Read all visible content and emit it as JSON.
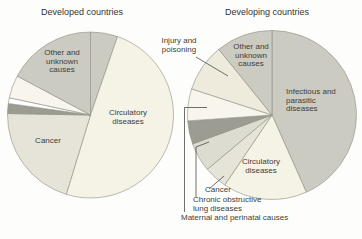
{
  "figure": {
    "background": "#fdfdfb",
    "text_color": "#3d3d3a",
    "slice_stroke": "#8e8e85",
    "leader_stroke": "#4a4a46"
  },
  "labels": {
    "title_developed": "Developed countries",
    "title_developing": "Developing countries",
    "other_unknown_left": "Other and\nunknown\ncauses",
    "circulatory_left": "Circulatory\ndiseases",
    "cancer_left": "Cancer",
    "injury_poisoning": "Injury and\npoisoning",
    "other_unknown_right": "Other and\nunknown\ncauses",
    "infectious": "Infectious and\nparasitic\ndiseases",
    "circulatory_right": "Circulatory\ndiseases",
    "cancer_right": "Cancer",
    "chronic": "Chronic obstructive\nlung diseases",
    "maternal": "Maternal and perinatal causes"
  },
  "chart_data": [
    {
      "type": "pie",
      "title": "Developed countries",
      "legend_position": "none",
      "center": {
        "x": 90.5,
        "y": 115
      },
      "radius": 83,
      "slices": [
        {
          "label": "",
          "value_pct": 5.3,
          "start_deg": 0,
          "end_deg": 19,
          "color": "#cbcbc1"
        },
        {
          "label": "Circulatory diseases",
          "value_pct": 49.4,
          "start_deg": 19,
          "end_deg": 197,
          "color": "#f5f2e6"
        },
        {
          "label": "Cancer",
          "value_pct": 20.6,
          "start_deg": 197,
          "end_deg": 271,
          "color": "#e6e4d8"
        },
        {
          "label": "",
          "value_pct": 1.9,
          "start_deg": 271,
          "end_deg": 278,
          "color": "#9c9c93"
        },
        {
          "label": "",
          "value_pct": 1.1,
          "start_deg": 278,
          "end_deg": 282,
          "color": "#ffffff"
        },
        {
          "label": "",
          "value_pct": 4.4,
          "start_deg": 282,
          "end_deg": 298,
          "color": "#f8f6ec"
        },
        {
          "label": "Other and unknown causes",
          "value_pct": 17.2,
          "start_deg": 298,
          "end_deg": 360,
          "color": "#cbcbc1"
        }
      ]
    },
    {
      "type": "pie",
      "title": "Developing countries",
      "legend_position": "none",
      "center": {
        "x": 272,
        "y": 115
      },
      "radius": 84.5,
      "slices": [
        {
          "label": "Infectious and parasitic diseases",
          "value_pct": 43.3,
          "start_deg": 0,
          "end_deg": 156,
          "color": "#cbcbc1"
        },
        {
          "label": "Circulatory diseases",
          "value_pct": 16.1,
          "start_deg": 156,
          "end_deg": 214,
          "color": "#f5f2e6"
        },
        {
          "label": "Cancer",
          "value_pct": 4.4,
          "start_deg": 214,
          "end_deg": 230,
          "color": "#e6e4d8"
        },
        {
          "label": "Chronic obstructive lung diseases",
          "value_pct": 5.6,
          "start_deg": 230,
          "end_deg": 250,
          "color": "#dddcd0"
        },
        {
          "label": "",
          "value_pct": 4.4,
          "start_deg": 250,
          "end_deg": 266,
          "color": "#9c9c93"
        },
        {
          "label": "Maternal and perinatal causes",
          "value_pct": 6.1,
          "start_deg": 266,
          "end_deg": 288,
          "color": "#f8f6ec"
        },
        {
          "label": "Injury and poisoning",
          "value_pct": 9.2,
          "start_deg": 288,
          "end_deg": 321,
          "color": "#eeebdd"
        },
        {
          "label": "Other and unknown causes",
          "value_pct": 10.8,
          "start_deg": 321,
          "end_deg": 360,
          "color": "#cbcbc1"
        }
      ]
    }
  ],
  "leader_lines": [
    {
      "target": "Injury and poisoning",
      "points": [
        [
          196,
          57
        ],
        [
          228,
          76
        ]
      ]
    },
    {
      "target": "Cancer (developing)",
      "points": [
        [
          209,
          189
        ],
        [
          224,
          176
        ]
      ]
    },
    {
      "target": "Chronic obstructive lung diseases",
      "points": [
        [
          196,
          197
        ],
        [
          196,
          147
        ],
        [
          209,
          142
        ]
      ]
    },
    {
      "target": "Maternal and perinatal causes",
      "points": [
        [
          184.5,
          212
        ],
        [
          184.5,
          107.5
        ],
        [
          207,
          107.5
        ]
      ]
    }
  ]
}
